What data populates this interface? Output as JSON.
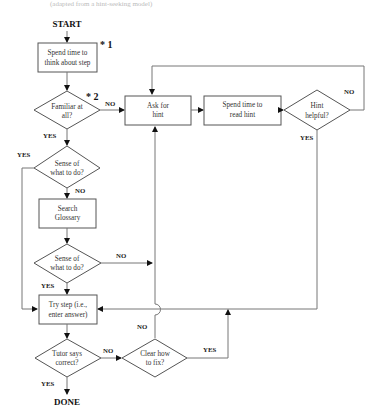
{
  "top_fragment": "(adapted from a hint-seeking model)",
  "terminals": {
    "start": "START",
    "done": "DONE"
  },
  "annotations": {
    "mark1": "* 1",
    "mark2": "* 2"
  },
  "nodes": {
    "think": [
      "Spend time to",
      "think about step"
    ],
    "familiar": [
      "Familiar at",
      "all?"
    ],
    "ask_hint": [
      "Ask for",
      "hint"
    ],
    "read_hint": [
      "Spend time to",
      "read hint"
    ],
    "hint_helpful": [
      "Hint",
      "helpful?"
    ],
    "sense1": [
      "Sense of",
      "what to do?"
    ],
    "glossary": [
      "Search",
      "Glossary"
    ],
    "sense2": [
      "Sense of",
      "what to do?"
    ],
    "try_step": [
      "Try step (i.e.,",
      "enter answer)"
    ],
    "tutor_correct": [
      "Tutor says",
      "correct?"
    ],
    "clear_fix": [
      "Clear how",
      "to fix?"
    ]
  },
  "edge_labels": {
    "familiar_no": "NO",
    "familiar_yes": "YES",
    "hint_helpful_no": "NO",
    "hint_helpful_yes": "YES",
    "sense1_yes": "YES",
    "sense1_no": "NO",
    "sense2_no": "NO",
    "sense2_yes": "YES",
    "tutor_no": "NO",
    "tutor_yes": "YES",
    "clear_no": "NO",
    "clear_yes": "YES"
  }
}
